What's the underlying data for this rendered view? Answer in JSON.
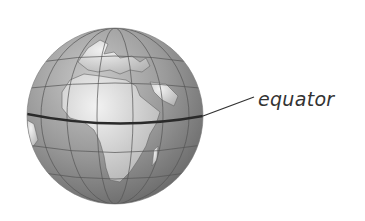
{
  "diagram": {
    "labels": {
      "equator": "equator"
    },
    "colors": {
      "ocean": "#8a8a8a",
      "land": "#d8d8d8",
      "grid": "#555555",
      "equator_line": "#2a2a2a",
      "background": "#ffffff"
    }
  }
}
